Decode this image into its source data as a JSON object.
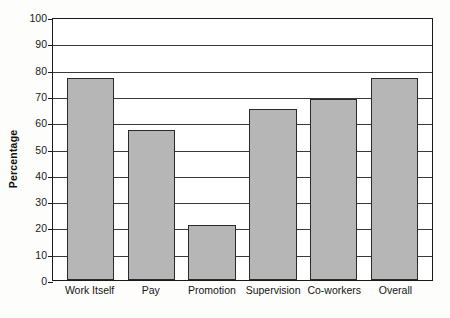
{
  "chart_data": {
    "type": "bar",
    "title": "",
    "xlabel": "",
    "ylabel": "Percentage",
    "categories": [
      "Work Itself",
      "Pay",
      "Promotion",
      "Supervision",
      "Co-workers",
      "Overall"
    ],
    "values": [
      77,
      57,
      21,
      65,
      69,
      77
    ],
    "ylim": [
      0,
      100
    ],
    "ytick_labels": [
      "100",
      "90",
      "80",
      "70",
      "60",
      "50",
      "40",
      "30",
      "20",
      "10",
      "0"
    ],
    "ytick_values": [
      100,
      90,
      80,
      70,
      60,
      50,
      40,
      30,
      20,
      10,
      0
    ],
    "grid": true,
    "grid_axis": "y",
    "legend": false,
    "bar_color": "#b6b6b6",
    "bar_edge_color": "#2a2a2a",
    "axis_color": "#1a1a1a",
    "plot_background": "#ffffff",
    "page_background": "#fdfdfc"
  }
}
